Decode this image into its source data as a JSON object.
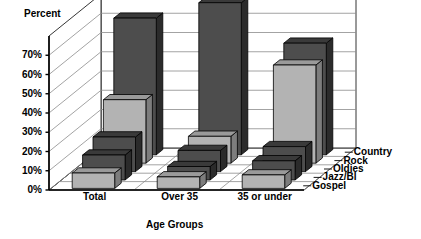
{
  "axes": {
    "y_title": "Percent",
    "x_title": "Age Groups",
    "y_ticks": [
      "70%",
      "60%",
      "50%",
      "40%",
      "30%",
      "20%",
      "10%",
      "0%"
    ]
  },
  "legend": {
    "items": [
      "Country",
      "Rock",
      "Oldies",
      "Jazz/Bl",
      "Gospel"
    ]
  },
  "categories": [
    "Total",
    "Over 35",
    "35 or under"
  ],
  "colors": {
    "dark_front": "#4d4d4d",
    "dark_top": "#3a3a3a",
    "dark_side": "#2b2b2b",
    "light_front": "#b3b3b3",
    "light_top": "#9a9a9a",
    "light_side": "#7d7d7d",
    "grid": "#8c8c8c",
    "axis": "#000000",
    "background": "#ffffff"
  },
  "chart_data": {
    "type": "bar",
    "title": "",
    "xlabel": "Age Groups",
    "ylabel": "Percent",
    "ylim": [
      0,
      80
    ],
    "grid": true,
    "legend_position": "right",
    "categories": [
      "Total",
      "Over 35",
      "35 or under"
    ],
    "series": [
      {
        "name": "Country",
        "shade": "dark",
        "values": [
          71,
          79,
          58
        ]
      },
      {
        "name": "Rock",
        "shade": "light",
        "values": [
          33,
          14,
          51
        ]
      },
      {
        "name": "Oldies",
        "shade": "dark",
        "values": [
          18,
          11,
          13
        ]
      },
      {
        "name": "Jazz/Bl",
        "shade": "dark",
        "values": [
          13,
          7,
          10
        ]
      },
      {
        "name": "Gospel",
        "shade": "light",
        "values": [
          8,
          6,
          7
        ]
      }
    ]
  }
}
